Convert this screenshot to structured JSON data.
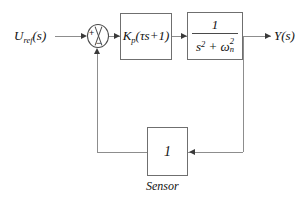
{
  "diagram": {
    "type": "control-system-block-diagram",
    "colors": {
      "wire": "#8d8d8d",
      "block_border": "#6f6f6f",
      "text": "#121212",
      "arrow": "#3a3a3a",
      "background": "#ffffff"
    }
  },
  "signals": {
    "input_label": "U",
    "input_subscript": "ref",
    "input_suffix": "(s)",
    "input_full": "U_ref(s)",
    "output_label": "Y(s)",
    "output_full": "Y(s)"
  },
  "summing_junction": {
    "name": "summing-junction",
    "plus_sign": "+",
    "minus_sign": "−",
    "inputs": [
      "U_ref(s)",
      "feedback"
    ],
    "operation": "U_ref(s) - feedback"
  },
  "blocks": [
    {
      "id": "controller",
      "name": "controller-block",
      "gain_symbol": "K",
      "gain_subscript": "p",
      "expression": "K_p(τs + 1)",
      "paren_open": "(",
      "tau": "τ",
      "s_term": "s",
      "plus": "+",
      "one": "1",
      "paren_close": ")"
    },
    {
      "id": "plant",
      "name": "plant-block",
      "numerator": "1",
      "denominator": "s² + ωₙ²",
      "den_s": "s",
      "den_s_sup": "2",
      "den_plus": "+",
      "den_omega": "ω",
      "den_omega_sup": "2",
      "den_omega_sub": "n",
      "expression": "1 / (s^2 + ω_n^2)"
    },
    {
      "id": "sensor",
      "name": "sensor-block",
      "gain": "1",
      "caption": "Sensor"
    }
  ]
}
